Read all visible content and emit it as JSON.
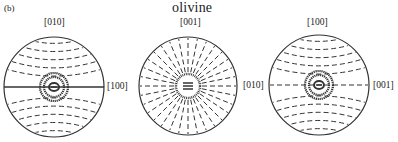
{
  "figure": {
    "panel_label": "(b)",
    "title": "olivine",
    "line_color": "#333333",
    "stereonets": [
      {
        "id": "net-1",
        "cx": 54,
        "cy": 87,
        "r": 50,
        "pattern": "concentric-horizontal",
        "has_equator_line": true,
        "top_label": "[010]",
        "right_label": "[100]"
      },
      {
        "id": "net-2",
        "cx": 188,
        "cy": 86,
        "r": 49,
        "pattern": "radial",
        "has_equator_line": false,
        "top_label": "[001]",
        "right_label": "[010]"
      },
      {
        "id": "net-3",
        "cx": 319,
        "cy": 85,
        "r": 50,
        "pattern": "concentric-horizontal",
        "has_equator_line": false,
        "top_label": "[100]",
        "right_label": "[001]"
      }
    ]
  }
}
